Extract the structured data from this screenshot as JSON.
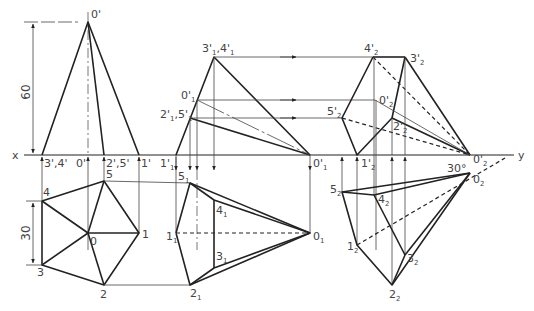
{
  "diagram": {
    "type": "orthographic-projection",
    "axis": {
      "left_label": "x",
      "right_label": "y"
    },
    "dimensions": {
      "height": "60",
      "edge": "30",
      "angle": "30°"
    },
    "front_view": {
      "labels": {
        "apex": "0'",
        "base_34": "3',4'",
        "base_0": "0'",
        "base_25": "2',5'",
        "base_1": "1'"
      }
    },
    "top_view": {
      "labels": {
        "p0": "0",
        "p1": "1",
        "p2": "2",
        "p3": "3",
        "p4": "4",
        "p5": "5"
      }
    },
    "aux1_elevation": {
      "labels": {
        "p34": {
          "main": "3'",
          "sub": "1",
          "main2": ",4'",
          "sub2": "1"
        },
        "p0": {
          "main": "0'",
          "sub": "1"
        },
        "p25": {
          "main": "2'",
          "sub": "1",
          "main2": ",5'",
          "sub2": "1"
        },
        "p1": {
          "main": "1'",
          "sub": "1"
        },
        "apex": {
          "main": "0'",
          "sub": "1"
        }
      }
    },
    "aux1_plan": {
      "labels": {
        "p5": {
          "main": "5",
          "sub": "1"
        },
        "p4": {
          "main": "4",
          "sub": "1"
        },
        "p1": {
          "main": "1",
          "sub": "1"
        },
        "p3": {
          "main": "3",
          "sub": "1"
        },
        "p2": {
          "main": "2",
          "sub": "1"
        },
        "p0": {
          "main": "0",
          "sub": "1"
        }
      }
    },
    "aux2_elevation": {
      "labels": {
        "p4": {
          "main": "4'",
          "sub": "2"
        },
        "p3": {
          "main": "3'",
          "sub": "2"
        },
        "p0top": {
          "main": "0'",
          "sub": "2"
        },
        "p5": {
          "main": "5'",
          "sub": "2"
        },
        "p2": {
          "main": "2'",
          "sub": "2"
        },
        "p1": {
          "main": "1'",
          "sub": "2"
        },
        "apex": {
          "main": "0'",
          "sub": "2"
        }
      }
    },
    "aux2_plan": {
      "labels": {
        "p5": {
          "main": "5",
          "sub": "2"
        },
        "p4": {
          "main": "4",
          "sub": "2"
        },
        "p0": {
          "main": "0",
          "sub": "2"
        },
        "p1": {
          "main": "1",
          "sub": "2"
        },
        "p3": {
          "main": "3",
          "sub": "2"
        },
        "p2": {
          "main": "2",
          "sub": "2"
        }
      }
    }
  }
}
